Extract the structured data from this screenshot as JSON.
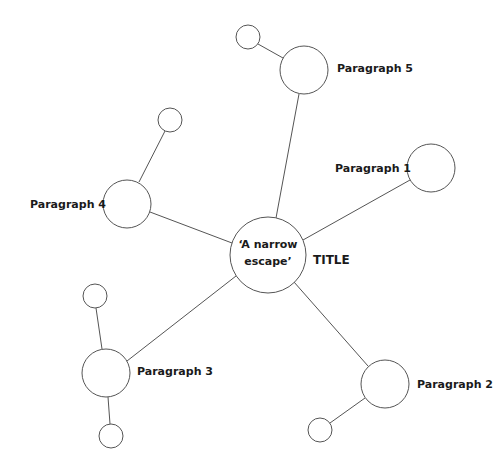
{
  "diagram": {
    "type": "spider-diagram",
    "center": {
      "line1": "‘A narrow",
      "line2": "escape’",
      "side_label": "TITLE"
    },
    "branches": [
      {
        "label": "Paragraph 1"
      },
      {
        "label": "Paragraph 2"
      },
      {
        "label": "Paragraph 3"
      },
      {
        "label": "Paragraph 4"
      },
      {
        "label": "Paragraph 5"
      }
    ],
    "colors": {
      "stroke": "#555555",
      "text": "#1a1a1a",
      "background": "#ffffff"
    }
  }
}
